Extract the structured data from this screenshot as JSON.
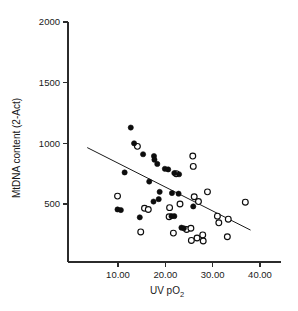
{
  "chart_data": {
    "type": "scatter",
    "title": "",
    "xlabel": "UV pO2",
    "xlabel_base": "UV pO",
    "xlabel_sub": "2",
    "ylabel": "MtDNA content (2-Act)",
    "xlim": [
      3.0,
      42.0
    ],
    "ylim": [
      0,
      2000
    ],
    "grid": false,
    "legend": "none",
    "xticks": [
      10,
      20,
      30,
      40
    ],
    "xtick_labels": [
      "10.00",
      "20.00",
      "30.00",
      "40.00"
    ],
    "yticks": [
      500,
      1000,
      1500,
      2000
    ],
    "ytick_labels": [
      "500",
      "1000",
      "1500",
      "2000"
    ],
    "series": [
      {
        "name": "filled-circles",
        "marker": "filled-circle",
        "color": "#0d0d0d",
        "points": [
          [
            12.7,
            1130
          ],
          [
            13.4,
            1000
          ],
          [
            15.3,
            910
          ],
          [
            17.6,
            895
          ],
          [
            17.7,
            865
          ],
          [
            18.3,
            830
          ],
          [
            19.9,
            790
          ],
          [
            20.6,
            785
          ],
          [
            21.9,
            755
          ],
          [
            22.9,
            745
          ],
          [
            11.4,
            760
          ],
          [
            16.6,
            685
          ],
          [
            18.8,
            600
          ],
          [
            21.4,
            590
          ],
          [
            22.8,
            585
          ],
          [
            17.5,
            520
          ],
          [
            18.6,
            540
          ],
          [
            25.9,
            480
          ],
          [
            9.9,
            455
          ],
          [
            10.6,
            450
          ],
          [
            14.6,
            390
          ],
          [
            21.3,
            400
          ],
          [
            21.9,
            400
          ],
          [
            23.4,
            305
          ],
          [
            23.9,
            300
          ]
        ]
      },
      {
        "name": "open-circles",
        "marker": "open-circle",
        "color": "#ffffff",
        "points": [
          [
            14.1,
            975
          ],
          [
            25.8,
            895
          ],
          [
            25.9,
            810
          ],
          [
            22.3,
            750
          ],
          [
            28.9,
            600
          ],
          [
            26.1,
            560
          ],
          [
            27.0,
            520
          ],
          [
            9.9,
            565
          ],
          [
            23.1,
            500
          ],
          [
            15.6,
            465
          ],
          [
            16.4,
            455
          ],
          [
            20.9,
            470
          ],
          [
            36.9,
            515
          ],
          [
            20.8,
            395
          ],
          [
            31.0,
            400
          ],
          [
            33.3,
            375
          ],
          [
            31.3,
            345
          ],
          [
            14.8,
            270
          ],
          [
            21.7,
            260
          ],
          [
            24.5,
            290
          ],
          [
            25.4,
            300
          ],
          [
            26.7,
            220
          ],
          [
            27.9,
            245
          ],
          [
            28.0,
            195
          ],
          [
            25.5,
            200
          ],
          [
            33.1,
            230
          ]
        ]
      }
    ],
    "trend_line": {
      "name": "regression-line",
      "x_start": 3.5,
      "y_start": 965,
      "x_end": 38.0,
      "y_end": 285
    }
  }
}
